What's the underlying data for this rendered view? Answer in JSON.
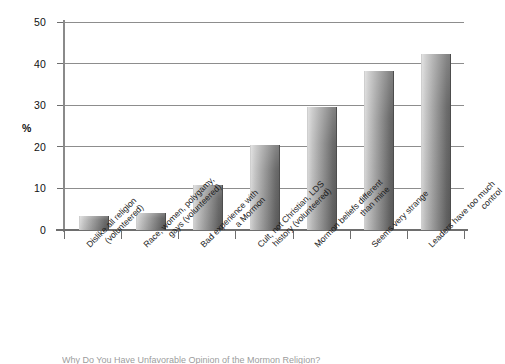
{
  "chart_data": {
    "type": "bar",
    "title": "",
    "xlabel": "",
    "ylabel": "%",
    "ylim": [
      0,
      50
    ],
    "ytick_values": [
      0,
      10,
      20,
      30,
      40,
      50
    ],
    "ytick_labels": [
      "0",
      "10",
      "20",
      "30",
      "40",
      "50"
    ],
    "grid": true,
    "legend": "none",
    "orientation": "vertical",
    "categories": [
      "Dislike all religion (volunteered)",
      "Race, women, polygamy, gays (volunteered)",
      "Bad experience with a Mormon",
      "Cult, not Christian, LDS history (volunteered)",
      "Mormon beliefs different than mine",
      "Seems very strange",
      "Leaders have too much control"
    ],
    "category_lines": [
      [
        "Dislike all religion",
        "(volunteered)"
      ],
      [
        "Race, women, polygamy,",
        "gays (volunteered)"
      ],
      [
        "Bad experience with",
        "a Mormon"
      ],
      [
        "Cult, not Christian, LDS",
        "history (volunteered)"
      ],
      [
        "Mormon beliefs different",
        "than mine"
      ],
      [
        "Seems very strange",
        ""
      ],
      [
        "Leaders have too much",
        "control"
      ]
    ],
    "values": [
      3.4,
      4.1,
      10.8,
      20.4,
      29.6,
      38.3,
      42.2
    ]
  },
  "style": {
    "bar_fill_light": "#d8d8d8",
    "bar_fill_dark": "#5c5c5c",
    "axis_color": "#6e6e6e",
    "grid_color": "#8d8d8d",
    "text_color": "#1a1a1a",
    "background": "#ffffff"
  },
  "caption": {
    "text": "Why Do You Have Unfavorable Opinion of the Mormon Religion?"
  }
}
